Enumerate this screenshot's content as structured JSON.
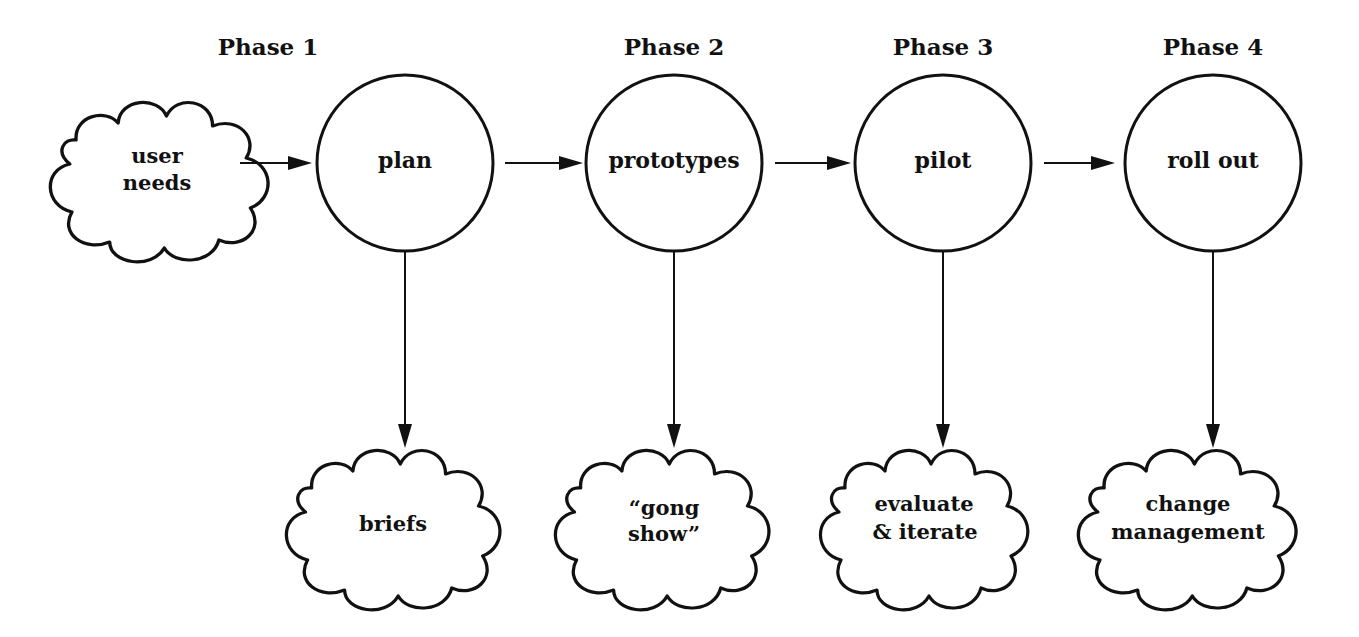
{
  "diagram": {
    "colors": {
      "ink": "#111111",
      "background": "#ffffff"
    },
    "phases": [
      {
        "title": "Phase 1",
        "node": "plan",
        "output_lines": [
          "briefs"
        ],
        "output": "briefs"
      },
      {
        "title": "Phase 2",
        "node": "prototypes",
        "output_lines": [
          "“gong",
          "show”"
        ],
        "output": "“gong show”"
      },
      {
        "title": "Phase 3",
        "node": "pilot",
        "output_lines": [
          "evaluate",
          "& iterate"
        ],
        "output": "evaluate & iterate"
      },
      {
        "title": "Phase 4",
        "node": "roll out",
        "output_lines": [
          "change",
          "management"
        ],
        "output": "change management"
      }
    ],
    "input": {
      "lines": [
        "user",
        "needs"
      ],
      "label": "user needs"
    },
    "edges": [
      {
        "from": "user needs",
        "to": "plan"
      },
      {
        "from": "plan",
        "to": "prototypes"
      },
      {
        "from": "prototypes",
        "to": "pilot"
      },
      {
        "from": "pilot",
        "to": "roll out"
      },
      {
        "from": "plan",
        "to": "briefs"
      },
      {
        "from": "prototypes",
        "to": "“gong show”"
      },
      {
        "from": "pilot",
        "to": "evaluate & iterate"
      },
      {
        "from": "roll out",
        "to": "change management"
      }
    ]
  }
}
